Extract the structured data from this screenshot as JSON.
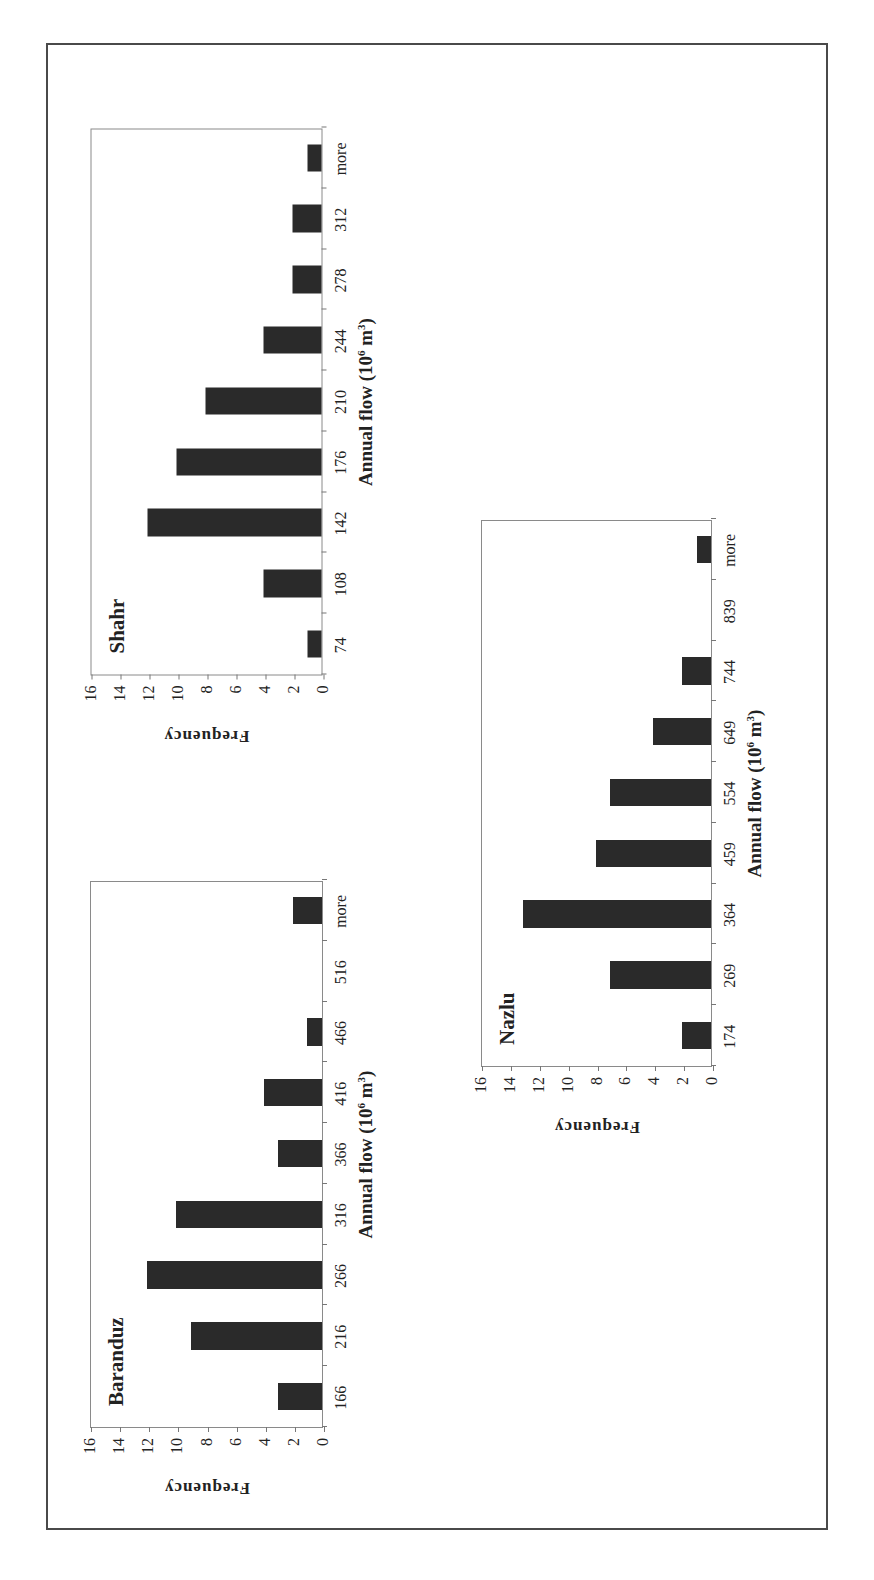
{
  "figure": {
    "frame": "bordered figure panel"
  },
  "chart_data": [
    {
      "type": "bar",
      "title": "Baranduz",
      "xlabel": "Annual flow (10^6 m^3)",
      "xlabel_parts": {
        "text": "Annual flow (10",
        "sup1": "6",
        "mid": " m",
        "sup2": "3",
        "end": ")"
      },
      "ylabel": "Frequency",
      "categories": [
        "166",
        "216",
        "266",
        "316",
        "366",
        "416",
        "466",
        "516",
        "more"
      ],
      "values": [
        3,
        9,
        12,
        10,
        3,
        4,
        1,
        0,
        2
      ],
      "ylim": [
        0,
        16
      ],
      "yticks": [
        "0",
        "2",
        "4",
        "6",
        "8",
        "10",
        "12",
        "14",
        "16"
      ],
      "grid": false,
      "orientation": "rotated 90° counter-clockwise on page"
    },
    {
      "type": "bar",
      "title": "Shahr",
      "xlabel": "Annual flow (10^6 m^3)",
      "xlabel_parts": {
        "text": "Annual flow (10",
        "sup1": "6",
        "mid": " m",
        "sup2": "3",
        "end": ")"
      },
      "ylabel": "Frequency",
      "categories": [
        "74",
        "108",
        "142",
        "176",
        "210",
        "244",
        "278",
        "312",
        "more"
      ],
      "values": [
        1,
        4,
        12,
        10,
        8,
        4,
        2,
        2,
        1
      ],
      "ylim": [
        0,
        16
      ],
      "yticks": [
        "0",
        "2",
        "4",
        "6",
        "8",
        "10",
        "12",
        "14",
        "16"
      ],
      "grid": false,
      "orientation": "rotated 90° counter-clockwise on page"
    },
    {
      "type": "bar",
      "title": "Nazlu",
      "xlabel": "Annual flow (10^6 m^3)",
      "xlabel_parts": {
        "text": "Annual flow (10",
        "sup1": "6",
        "mid": " m",
        "sup2": "3",
        "end": ")"
      },
      "ylabel": "Frequency",
      "categories": [
        "174",
        "269",
        "364",
        "459",
        "554",
        "649",
        "744",
        "839",
        "more"
      ],
      "values": [
        2,
        7,
        13,
        8,
        7,
        4,
        2,
        0,
        1
      ],
      "ylim": [
        0,
        16
      ],
      "yticks": [
        "0",
        "2",
        "4",
        "6",
        "8",
        "10",
        "12",
        "14",
        "16"
      ],
      "grid": false,
      "orientation": "rotated 90° counter-clockwise on page"
    }
  ],
  "colors": {
    "bar": "#2a2a2a",
    "axis": "#8a8a8a",
    "frame": "#4a4a4a"
  }
}
